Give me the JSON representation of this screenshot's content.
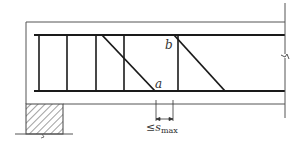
{
  "diagram": {
    "labels": {
      "point_a": "a",
      "point_b": "b",
      "spacing_prefix": "≤s",
      "spacing_sub": "max"
    },
    "colors": {
      "line": "#1a1a1a",
      "outline": "#555555",
      "hatch": "#444444"
    }
  }
}
